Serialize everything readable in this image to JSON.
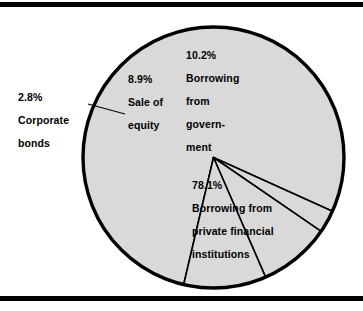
{
  "figure": {
    "background_color": "#ffffff",
    "rule_color": "#000000",
    "top_rule_name": "top-rule",
    "bottom_rule_name": "bottom-rule"
  },
  "chart_data": {
    "type": "pie",
    "title": "",
    "subtitle": "",
    "xlabel": "",
    "ylabel": "",
    "grid": false,
    "legend_position": "none",
    "units": "percent",
    "total": 100.0,
    "slice_fill_color": "#d9d9d9",
    "slice_edge_color": "#000000",
    "categories": [
      "Borrowing from private financial institutions",
      "Corporate bonds",
      "Sale of equity",
      "Borrowing from government"
    ],
    "values": [
      78.1,
      2.8,
      8.9,
      10.2
    ],
    "labels": [
      {
        "name": "private-financial-institutions",
        "percent": "78.1%",
        "text": "Borrowing from\nprivate financial\ninstitutions",
        "value": 78.1,
        "placement": "inside"
      },
      {
        "name": "corporate-bonds",
        "percent": "2.8%",
        "text": "Corporate\nbonds",
        "value": 2.8,
        "placement": "outside-left-with-leader"
      },
      {
        "name": "sale-of-equity",
        "percent": "8.9%",
        "text": "Sale of\nequity",
        "value": 8.9,
        "placement": "inside"
      },
      {
        "name": "borrowing-from-government",
        "percent": "10.2%",
        "text": "Borrowing\nfrom\ngovern-\nment",
        "value": 10.2,
        "placement": "inside"
      }
    ]
  },
  "labels": {
    "government": {
      "percent": "10.2%",
      "line1": "Borrowing",
      "line2": "from",
      "line3": "govern-",
      "line4": "ment"
    },
    "equity": {
      "percent": "8.9%",
      "line1": "Sale of",
      "line2": "equity"
    },
    "bonds": {
      "percent": "2.8%",
      "line1": "Corporate",
      "line2": "bonds"
    },
    "private": {
      "percent": "78.1%",
      "line1": "Borrowing from",
      "line2": "private financial",
      "line3": "institutions"
    }
  }
}
